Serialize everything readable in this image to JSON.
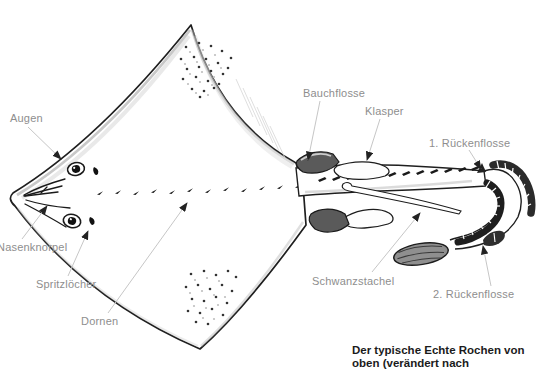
{
  "figure": {
    "labels": {
      "augen": "Augen",
      "nasenknorpel": "Nasenknorpel",
      "spritzloecher": "Spritzlöcher",
      "dornen": "Dornen",
      "bauchflosse": "Bauchflosse",
      "klasper": "Klasper",
      "rueckenflosse1": "1. Rückenflosse",
      "schwanzstachel": "Schwanzstachel",
      "rueckenflosse2": "2. Rückenflosse"
    },
    "caption": {
      "line1": "Der typische Echte Rochen von",
      "line2": "oben (verändert nach"
    },
    "colors": {
      "background": "#ffffff",
      "ink": "#1f1f1f",
      "label_text": "#8e8e8e",
      "caption_text": "#1b1b1b",
      "leader_line": "#c6c6c6",
      "arrowhead": "#222222",
      "fin_dark": "#4f4f4f",
      "paddle_gray": "#8f8f8f"
    }
  }
}
